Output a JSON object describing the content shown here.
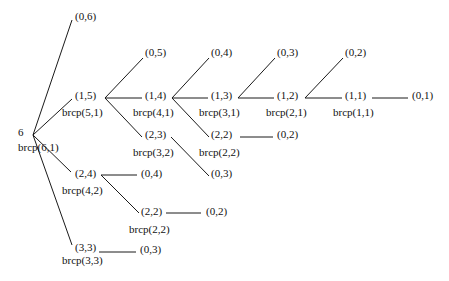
{
  "diagram": {
    "root": {
      "value": "6",
      "call": "brcp(6,1)"
    },
    "nodes": {
      "n06": "(0,6)",
      "n15": "(1,5)",
      "n15_call": "brcp(5,1)",
      "n24": "(2,4)",
      "n24_call": "brcp(4,2)",
      "n33": "(3,3)",
      "n33_call": "brcp(3,3)",
      "n05": "(0,5)",
      "n14": "(1,4)",
      "n14_call": "brcp(4,1)",
      "n23": "(2,3)",
      "n23_call": "brcp(3,2)",
      "n04_a": "(0,4)",
      "n13": "(1,3)",
      "n13_call": "brcp(3,1)",
      "n22_a": "(2,2)",
      "n22_a_call": "brcp(2,2)",
      "n02_a": "(0,2)",
      "n03_a": "(0,3)",
      "n03_b": "(0,3)",
      "n12": "(1,2)",
      "n12_call": "brcp(2,1)",
      "n02_b": "(0,2)",
      "n11": "(1,1)",
      "n11_call": "brcp(1,1)",
      "n01": "(0,1)",
      "n04_b": "(0,4)",
      "n22_b": "(2,2)",
      "n22_b_call": "brcp(2,2)",
      "n02_c": "(0,2)",
      "n03_c": "(0,3)"
    },
    "edges": [
      {
        "from": "6",
        "to": "(0,6)"
      },
      {
        "from": "6",
        "to": "(1,5)"
      },
      {
        "from": "6",
        "to": "(2,4)"
      },
      {
        "from": "6",
        "to": "(3,3)"
      },
      {
        "from": "(1,5)",
        "to": "(0,5)"
      },
      {
        "from": "(1,5)",
        "to": "(1,4)"
      },
      {
        "from": "(1,5)",
        "to": "(2,3)"
      },
      {
        "from": "(1,4)",
        "to": "(0,4)"
      },
      {
        "from": "(1,4)",
        "to": "(1,3)"
      },
      {
        "from": "(1,4)",
        "to": "(2,2)"
      },
      {
        "from": "(2,3)",
        "to": "(0,3)"
      },
      {
        "from": "(1,3)",
        "to": "(0,3)"
      },
      {
        "from": "(1,3)",
        "to": "(1,2)"
      },
      {
        "from": "(2,2)",
        "to": "(0,2)"
      },
      {
        "from": "(1,2)",
        "to": "(0,2)"
      },
      {
        "from": "(1,2)",
        "to": "(1,1)"
      },
      {
        "from": "(1,1)",
        "to": "(0,1)"
      },
      {
        "from": "(2,4)",
        "to": "(0,4)"
      },
      {
        "from": "(2,4)",
        "to": "(2,2)"
      },
      {
        "from": "(2,2)",
        "to": "(0,2)"
      },
      {
        "from": "(3,3)",
        "to": "(0,3)"
      }
    ]
  }
}
